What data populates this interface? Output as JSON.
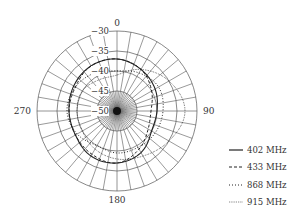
{
  "chart_data": {
    "type": "polar-line",
    "title": "",
    "angular_axis": {
      "direction": "clockwise",
      "zero_at": "top",
      "tick_labels": [
        "0",
        "90",
        "180",
        "270"
      ],
      "tick_angles": [
        0,
        90,
        180,
        270
      ],
      "spoke_step_deg": 10
    },
    "radial_axis": {
      "range": [
        -50,
        -30
      ],
      "tick_values": [
        -30,
        -35,
        -40,
        -45,
        -50
      ],
      "tick_labels": [
        "−30",
        "−35",
        "−40",
        "−45",
        "−50"
      ],
      "unit": "dB"
    },
    "theta": [
      0,
      30,
      60,
      90,
      120,
      150,
      180,
      210,
      240,
      270,
      300,
      330
    ],
    "series": [
      {
        "name": "402 MHz",
        "style": "solid",
        "values": [
          -37,
          -38,
          -39,
          -40,
          -40,
          -38,
          -37,
          -37,
          -38,
          -38,
          -37.5,
          -37
        ]
      },
      {
        "name": "433 MHz",
        "style": "dashed",
        "values": [
          -37,
          -38,
          -40,
          -41.5,
          -41,
          -39,
          -37,
          -37.5,
          -38,
          -38,
          -38,
          -37
        ]
      },
      {
        "name": "868 MHz",
        "style": "dotted",
        "values": [
          -40,
          -39,
          -38,
          -38.5,
          -39,
          -39.5,
          -39.5,
          -40,
          -38.5,
          -37.5,
          -38,
          -39
        ]
      },
      {
        "name": "915 MHz",
        "style": "fine-dotted",
        "values": [
          -41,
          -38,
          -35,
          -33,
          -35,
          -37,
          -38,
          -39,
          -40,
          -40,
          -40,
          -41
        ]
      }
    ],
    "legend_position": "lower-right",
    "grid": true
  },
  "legend": {
    "items": [
      {
        "label": "402 MHz"
      },
      {
        "label": "433 MHz"
      },
      {
        "label": "868 MHz"
      },
      {
        "label": "915 MHz"
      }
    ]
  },
  "colors": {
    "grid": "#555555",
    "trace": "#222222",
    "text": "#333333"
  }
}
